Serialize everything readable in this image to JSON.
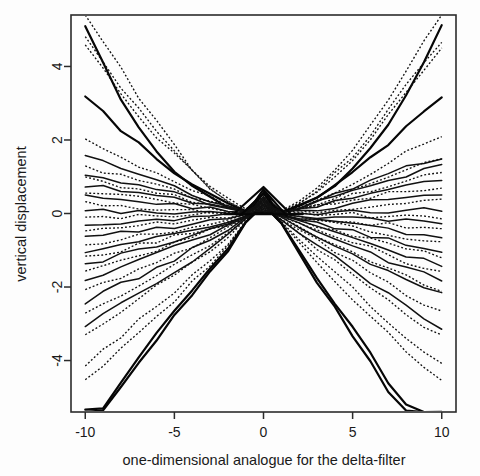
{
  "figure": {
    "background_color": "#fdfdfd",
    "foreground_color": "#111111",
    "plot_box": {
      "left": 71,
      "top": 15,
      "right": 456,
      "bottom": 412
    }
  },
  "chart_data": {
    "type": "line",
    "title": "",
    "subtitle": "",
    "xlabel": "one-dimensional analogue for the delta-filter",
    "ylabel": "vertical displacement",
    "xlim": [
      -10.8,
      10.8
    ],
    "ylim": [
      -5.4,
      5.4
    ],
    "xticks": [
      -10,
      -5,
      0,
      5,
      10
    ],
    "xtick_labels": [
      "-10",
      "-5",
      "0",
      "5",
      "10"
    ],
    "yticks": [
      -4,
      -2,
      0,
      2,
      4
    ],
    "ytick_labels": [
      "-4",
      "-2",
      "0",
      "2",
      "4"
    ],
    "grid": false,
    "legend": null,
    "legend_position": "none",
    "annotations": [
      "Bundle of curves converging near the origin and fanning out symmetrically toward both ends.",
      "A sharp triangular spike of the heaviest solid curves peaks at x=0 reaching about y=0.7.",
      "Two line styles are used: solid black curves and dotted black curves."
    ],
    "x": [
      -10,
      -9,
      -8,
      -7,
      -6,
      -5,
      -4,
      -3,
      -2,
      -1,
      -0.5,
      0,
      0.5,
      1,
      2,
      3,
      4,
      5,
      6,
      7,
      8,
      9,
      10
    ],
    "series": [
      {
        "name": "curve-01",
        "style": "solid",
        "end_left": 5.05,
        "end_right": 5.1,
        "values": [
          5.05,
          4.05,
          3.15,
          2.4,
          1.75,
          1.2,
          0.78,
          0.44,
          0.2,
          0.05,
          0.3,
          0.66,
          0.28,
          0.04,
          0.2,
          0.45,
          0.8,
          1.24,
          1.8,
          2.46,
          3.21,
          4.11,
          5.1
        ]
      },
      {
        "name": "curve-02",
        "style": "dotted",
        "end_left": 5.4,
        "end_right": 5.4,
        "values": [
          5.4,
          4.7,
          3.95,
          3.2,
          2.48,
          1.82,
          1.24,
          0.76,
          0.38,
          0.1,
          0.26,
          0.6,
          0.24,
          0.06,
          0.34,
          0.72,
          1.18,
          1.74,
          2.38,
          3.1,
          3.88,
          4.72,
          5.4
        ]
      },
      {
        "name": "curve-03",
        "style": "dotted",
        "end_left": 4.86,
        "end_right": 4.7,
        "values": [
          4.86,
          4.12,
          3.44,
          2.8,
          2.2,
          1.66,
          1.16,
          0.72,
          0.36,
          0.08,
          0.24,
          0.58,
          0.22,
          0.05,
          0.3,
          0.66,
          1.08,
          1.58,
          2.14,
          2.78,
          3.48,
          4.06,
          4.7
        ]
      },
      {
        "name": "curve-04",
        "style": "dotted",
        "end_left": 4.55,
        "end_right": 4.46,
        "values": [
          4.55,
          3.9,
          3.28,
          2.68,
          2.12,
          1.6,
          1.12,
          0.7,
          0.34,
          0.08,
          0.22,
          0.54,
          0.2,
          0.05,
          0.28,
          0.62,
          1.02,
          1.5,
          2.04,
          2.64,
          3.3,
          3.86,
          4.46
        ]
      },
      {
        "name": "curve-05",
        "style": "solid",
        "end_left": 3.2,
        "end_right": 3.18,
        "values": [
          3.2,
          2.72,
          2.28,
          1.88,
          1.5,
          1.16,
          0.84,
          0.54,
          0.28,
          0.06,
          0.22,
          0.56,
          0.2,
          0.04,
          0.22,
          0.48,
          0.78,
          1.12,
          1.5,
          1.92,
          2.36,
          2.76,
          3.18
        ]
      },
      {
        "name": "curve-06",
        "style": "dotted",
        "end_left": 2.06,
        "end_right": 2.08,
        "values": [
          2.06,
          1.8,
          1.55,
          1.32,
          1.08,
          0.86,
          0.64,
          0.42,
          0.22,
          0.05,
          0.2,
          0.5,
          0.18,
          0.04,
          0.2,
          0.4,
          0.62,
          0.86,
          1.12,
          1.4,
          1.68,
          1.88,
          2.08
        ]
      },
      {
        "name": "curve-07",
        "style": "solid",
        "end_left": 1.58,
        "end_right": 1.52,
        "values": [
          1.58,
          1.4,
          1.22,
          1.04,
          0.88,
          0.7,
          0.54,
          0.38,
          0.2,
          0.04,
          0.18,
          0.46,
          0.16,
          0.03,
          0.16,
          0.32,
          0.5,
          0.68,
          0.88,
          1.08,
          1.26,
          1.4,
          1.52
        ]
      },
      {
        "name": "curve-08",
        "style": "dotted",
        "end_left": 1.3,
        "end_right": 1.44,
        "values": [
          1.3,
          1.16,
          1.02,
          0.88,
          0.74,
          0.6,
          0.46,
          0.32,
          0.18,
          0.03,
          0.18,
          0.44,
          0.16,
          0.03,
          0.16,
          0.3,
          0.46,
          0.64,
          0.84,
          1.02,
          1.18,
          1.32,
          1.44
        ]
      },
      {
        "name": "curve-09",
        "style": "solid",
        "end_left": 1.1,
        "end_right": 1.3,
        "values": [
          1.1,
          0.98,
          0.86,
          0.76,
          0.64,
          0.52,
          0.4,
          0.28,
          0.16,
          0.03,
          0.16,
          0.42,
          0.15,
          0.03,
          0.14,
          0.28,
          0.42,
          0.58,
          0.74,
          0.92,
          1.06,
          1.18,
          1.3
        ]
      },
      {
        "name": "curve-10",
        "style": "dotted",
        "end_left": 0.94,
        "end_right": 1.08,
        "values": [
          0.94,
          0.84,
          0.74,
          0.64,
          0.55,
          0.45,
          0.35,
          0.24,
          0.14,
          0.03,
          0.15,
          0.4,
          0.14,
          0.02,
          0.12,
          0.24,
          0.36,
          0.5,
          0.64,
          0.78,
          0.92,
          1.0,
          1.08
        ]
      },
      {
        "name": "curve-11",
        "style": "solid",
        "end_left": 0.78,
        "end_right": 0.88,
        "values": [
          0.78,
          0.7,
          0.62,
          0.54,
          0.46,
          0.38,
          0.3,
          0.21,
          0.12,
          0.02,
          0.14,
          0.38,
          0.13,
          0.02,
          0.11,
          0.21,
          0.31,
          0.42,
          0.54,
          0.66,
          0.76,
          0.82,
          0.88
        ]
      },
      {
        "name": "curve-12",
        "style": "dotted",
        "end_left": 0.62,
        "end_right": 0.72,
        "values": [
          0.62,
          0.56,
          0.5,
          0.44,
          0.37,
          0.31,
          0.24,
          0.17,
          0.1,
          0.02,
          0.13,
          0.36,
          0.12,
          0.02,
          0.09,
          0.18,
          0.26,
          0.35,
          0.44,
          0.54,
          0.62,
          0.67,
          0.72
        ]
      },
      {
        "name": "curve-13",
        "style": "solid",
        "end_left": 0.44,
        "end_right": 0.52,
        "values": [
          0.44,
          0.4,
          0.36,
          0.31,
          0.27,
          0.22,
          0.18,
          0.13,
          0.07,
          0.02,
          0.12,
          0.34,
          0.11,
          0.02,
          0.07,
          0.13,
          0.19,
          0.25,
          0.32,
          0.39,
          0.45,
          0.48,
          0.52
        ]
      },
      {
        "name": "curve-14",
        "style": "dotted",
        "end_left": 0.26,
        "end_right": 0.34,
        "values": [
          0.26,
          0.24,
          0.21,
          0.19,
          0.16,
          0.13,
          0.11,
          0.08,
          0.05,
          0.01,
          0.11,
          0.32,
          0.1,
          0.01,
          0.05,
          0.08,
          0.12,
          0.16,
          0.2,
          0.24,
          0.28,
          0.31,
          0.34
        ]
      },
      {
        "name": "curve-15",
        "style": "solid",
        "end_left": 0.08,
        "end_right": 0.12,
        "values": [
          0.08,
          0.07,
          0.06,
          0.06,
          0.05,
          0.04,
          0.03,
          0.02,
          0.01,
          0.0,
          0.1,
          0.3,
          0.09,
          0.0,
          0.01,
          0.02,
          0.04,
          0.05,
          0.06,
          0.08,
          0.09,
          0.11,
          0.12
        ]
      },
      {
        "name": "curve-16",
        "style": "dotted",
        "end_left": -0.1,
        "end_right": -0.08,
        "values": [
          -0.1,
          -0.09,
          -0.08,
          -0.07,
          -0.06,
          -0.05,
          -0.04,
          -0.03,
          -0.02,
          -0.01,
          0.08,
          0.28,
          0.08,
          -0.01,
          -0.01,
          -0.02,
          -0.03,
          -0.04,
          -0.05,
          -0.06,
          -0.07,
          -0.08,
          -0.08
        ]
      },
      {
        "name": "curve-17",
        "style": "solid",
        "end_left": -0.3,
        "end_right": -0.26,
        "values": [
          -0.3,
          -0.27,
          -0.24,
          -0.21,
          -0.18,
          -0.15,
          -0.12,
          -0.09,
          -0.05,
          -0.01,
          0.07,
          0.26,
          0.07,
          -0.01,
          -0.04,
          -0.07,
          -0.1,
          -0.13,
          -0.16,
          -0.19,
          -0.22,
          -0.24,
          -0.26
        ]
      },
      {
        "name": "curve-18",
        "style": "dotted",
        "end_left": -0.48,
        "end_right": -0.44,
        "values": [
          -0.48,
          -0.43,
          -0.38,
          -0.34,
          -0.29,
          -0.24,
          -0.19,
          -0.14,
          -0.08,
          -0.02,
          0.06,
          0.24,
          0.06,
          -0.02,
          -0.07,
          -0.12,
          -0.17,
          -0.21,
          -0.26,
          -0.31,
          -0.36,
          -0.4,
          -0.44
        ]
      },
      {
        "name": "curve-19",
        "style": "solid",
        "end_left": -0.68,
        "end_right": -0.62,
        "values": [
          -0.68,
          -0.61,
          -0.55,
          -0.48,
          -0.41,
          -0.34,
          -0.27,
          -0.19,
          -0.12,
          -0.03,
          0.05,
          0.22,
          0.05,
          -0.03,
          -0.1,
          -0.17,
          -0.24,
          -0.3,
          -0.37,
          -0.44,
          -0.51,
          -0.57,
          -0.62
        ]
      },
      {
        "name": "curve-20",
        "style": "dotted",
        "end_left": -0.86,
        "end_right": -0.82,
        "values": [
          -0.86,
          -0.78,
          -0.69,
          -0.61,
          -0.52,
          -0.44,
          -0.35,
          -0.25,
          -0.16,
          -0.04,
          0.04,
          0.2,
          0.04,
          -0.04,
          -0.13,
          -0.22,
          -0.31,
          -0.4,
          -0.49,
          -0.58,
          -0.67,
          -0.75,
          -0.82
        ]
      },
      {
        "name": "curve-21",
        "style": "solid",
        "end_left": -1.05,
        "end_right": -1.0,
        "values": [
          -1.05,
          -0.95,
          -0.85,
          -0.74,
          -0.64,
          -0.53,
          -0.43,
          -0.31,
          -0.2,
          -0.05,
          0.03,
          0.18,
          0.03,
          -0.05,
          -0.16,
          -0.27,
          -0.38,
          -0.49,
          -0.6,
          -0.71,
          -0.82,
          -0.92,
          -1.0
        ]
      },
      {
        "name": "curve-22",
        "style": "dotted",
        "end_left": -1.22,
        "end_right": -1.18,
        "values": [
          -1.22,
          -1.1,
          -0.98,
          -0.86,
          -0.74,
          -0.62,
          -0.5,
          -0.36,
          -0.23,
          -0.06,
          0.02,
          0.16,
          0.02,
          -0.06,
          -0.19,
          -0.32,
          -0.45,
          -0.58,
          -0.71,
          -0.84,
          -0.97,
          -1.08,
          -1.18
        ]
      },
      {
        "name": "curve-23",
        "style": "solid",
        "end_left": -1.42,
        "end_right": -1.4,
        "values": [
          -1.42,
          -1.28,
          -1.14,
          -1.0,
          -0.86,
          -0.72,
          -0.58,
          -0.42,
          -0.27,
          -0.07,
          0.02,
          0.14,
          0.02,
          -0.07,
          -0.22,
          -0.38,
          -0.53,
          -0.68,
          -0.84,
          -0.99,
          -1.14,
          -1.28,
          -1.4
        ]
      },
      {
        "name": "curve-24",
        "style": "dotted",
        "end_left": -1.62,
        "end_right": -1.58,
        "values": [
          -1.62,
          -1.46,
          -1.3,
          -1.14,
          -0.98,
          -0.82,
          -0.66,
          -0.48,
          -0.31,
          -0.08,
          0.01,
          0.12,
          0.01,
          -0.08,
          -0.25,
          -0.43,
          -0.6,
          -0.78,
          -0.95,
          -1.12,
          -1.3,
          -1.45,
          -1.58
        ]
      },
      {
        "name": "curve-25",
        "style": "solid",
        "end_left": -1.84,
        "end_right": -1.78,
        "values": [
          -1.84,
          -1.66,
          -1.48,
          -1.3,
          -1.12,
          -0.94,
          -0.75,
          -0.55,
          -0.35,
          -0.09,
          0.01,
          0.1,
          0.01,
          -0.09,
          -0.29,
          -0.49,
          -0.69,
          -0.88,
          -1.08,
          -1.28,
          -1.47,
          -1.64,
          -1.78
        ]
      },
      {
        "name": "curve-26",
        "style": "dotted",
        "end_left": -2.12,
        "end_right": -2.06,
        "values": [
          -2.12,
          -1.92,
          -1.72,
          -1.51,
          -1.3,
          -1.09,
          -0.87,
          -0.64,
          -0.41,
          -0.11,
          0.0,
          0.08,
          0.0,
          -0.11,
          -0.34,
          -0.57,
          -0.8,
          -1.02,
          -1.25,
          -1.48,
          -1.7,
          -1.9,
          -2.06
        ]
      },
      {
        "name": "curve-27",
        "style": "solid",
        "end_left": -2.4,
        "end_right": -2.22,
        "values": [
          -2.4,
          -2.17,
          -1.94,
          -1.71,
          -1.47,
          -1.23,
          -0.99,
          -0.73,
          -0.47,
          -0.12,
          0.0,
          0.06,
          0.0,
          -0.12,
          -0.37,
          -0.62,
          -0.86,
          -1.1,
          -1.34,
          -1.58,
          -1.82,
          -2.03,
          -2.22
        ]
      },
      {
        "name": "curve-28",
        "style": "dotted",
        "end_left": -2.7,
        "end_right": -2.66,
        "values": [
          -2.7,
          -2.44,
          -2.18,
          -1.92,
          -1.66,
          -1.39,
          -1.11,
          -0.82,
          -0.53,
          -0.14,
          0.0,
          0.04,
          0.0,
          -0.14,
          -0.44,
          -0.74,
          -1.03,
          -1.32,
          -1.61,
          -1.9,
          -2.18,
          -2.43,
          -2.66
        ]
      },
      {
        "name": "curve-29",
        "style": "solid",
        "end_left": -3.05,
        "end_right": -3.12,
        "values": [
          -3.05,
          -2.76,
          -2.46,
          -2.17,
          -1.87,
          -1.57,
          -1.26,
          -0.93,
          -0.6,
          -0.16,
          0.0,
          0.02,
          0.0,
          -0.16,
          -0.51,
          -0.86,
          -1.2,
          -1.54,
          -1.88,
          -2.22,
          -2.55,
          -2.85,
          -3.12
        ]
      },
      {
        "name": "curve-30",
        "style": "dotted",
        "end_left": -3.28,
        "end_right": -3.32,
        "values": [
          -3.28,
          -2.97,
          -2.65,
          -2.33,
          -2.01,
          -1.69,
          -1.35,
          -1.0,
          -0.64,
          -0.17,
          0.0,
          0.01,
          0.0,
          -0.17,
          -0.54,
          -0.92,
          -1.28,
          -1.64,
          -2.0,
          -2.36,
          -2.72,
          -3.04,
          -3.32
        ]
      },
      {
        "name": "curve-31",
        "style": "dotted",
        "end_left": -4.1,
        "end_right": -4.06,
        "values": [
          -4.1,
          -3.72,
          -3.33,
          -2.93,
          -2.53,
          -2.12,
          -1.7,
          -1.26,
          -0.81,
          -0.21,
          0.0,
          0.0,
          0.0,
          -0.21,
          -0.68,
          -1.15,
          -1.61,
          -2.06,
          -2.51,
          -2.96,
          -3.4,
          -3.78,
          -4.06
        ]
      },
      {
        "name": "curve-32",
        "style": "dotted",
        "end_left": -4.55,
        "end_right": -4.52,
        "values": [
          -4.55,
          -4.13,
          -3.7,
          -3.26,
          -2.81,
          -2.36,
          -1.89,
          -1.4,
          -0.9,
          -0.23,
          0.0,
          0.0,
          0.0,
          -0.23,
          -0.76,
          -1.28,
          -1.79,
          -2.29,
          -2.79,
          -3.29,
          -3.78,
          -4.2,
          -4.52
        ]
      },
      {
        "name": "curve-33",
        "style": "solid",
        "end_left": -5.4,
        "end_right": -5.4,
        "values": [
          -5.4,
          -5.25,
          -4.6,
          -3.95,
          -3.3,
          -2.68,
          -2.08,
          -1.5,
          -0.95,
          -0.24,
          0.0,
          0.0,
          0.0,
          -0.24,
          -0.98,
          -1.72,
          -2.45,
          -3.15,
          -3.85,
          -4.55,
          -5.25,
          -5.4,
          -5.4
        ]
      },
      {
        "name": "curve-34",
        "style": "solid",
        "end_left": -5.4,
        "end_right": -5.4,
        "values": [
          -5.4,
          -5.4,
          -4.78,
          -4.1,
          -3.44,
          -2.8,
          -2.18,
          -1.58,
          -1.0,
          -0.26,
          0.0,
          0.0,
          0.0,
          -0.26,
          -1.04,
          -1.82,
          -2.58,
          -3.32,
          -4.06,
          -4.8,
          -5.4,
          -5.4,
          -5.4
        ]
      }
    ]
  }
}
